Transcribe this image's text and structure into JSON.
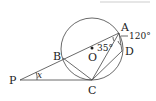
{
  "diagram": {
    "type": "geometry-circle-tangent",
    "circle": {
      "center_label": "O",
      "cx": 92,
      "cy": 49,
      "r": 31
    },
    "points": {
      "A": {
        "label": "A",
        "x": 119,
        "y": 33
      },
      "B": {
        "label": "B",
        "x": 63,
        "y": 58
      },
      "C": {
        "label": "C",
        "x": 92,
        "y": 80
      },
      "D": {
        "label": "D",
        "x": 122,
        "y": 51
      },
      "P": {
        "label": "P",
        "x": 20,
        "y": 80
      },
      "O": {
        "label": "O",
        "x": 92,
        "y": 49
      }
    },
    "angles": {
      "BAC": "35°",
      "CAD_exterior": "120°",
      "P": "x"
    },
    "segments": [
      "PA",
      "PC",
      "AC",
      "AD",
      "CD",
      "BC"
    ]
  }
}
